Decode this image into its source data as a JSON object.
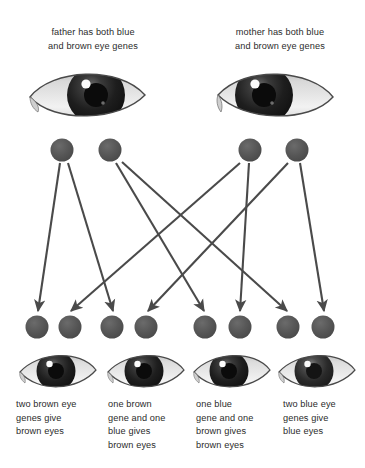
{
  "diagram": {
    "type": "punnett-style inheritance flow",
    "colors": {
      "gene_circle": "#5a5a5a",
      "arrow": "#4a4a4a",
      "text": "#2b2b2b",
      "background": "#ffffff",
      "iris_dark": "#1a1a1a",
      "sclera": "#e8e8e8"
    }
  },
  "parents": [
    {
      "id": "father",
      "caption_lines": [
        "father has both blue",
        "and brown eye genes"
      ],
      "eye": {
        "name": "father-eye",
        "iris": "brown",
        "facing": "right"
      },
      "genes": [
        {
          "id": "father-gene-1",
          "allele": "brown",
          "cx": 62,
          "cy": 150
        },
        {
          "id": "father-gene-2",
          "allele": "blue",
          "cx": 110,
          "cy": 150
        }
      ]
    },
    {
      "id": "mother",
      "caption_lines": [
        "mother has both blue",
        "and brown eye genes"
      ],
      "eye": {
        "name": "mother-eye",
        "iris": "brown",
        "facing": "left"
      },
      "genes": [
        {
          "id": "mother-gene-1",
          "allele": "brown",
          "cx": 250,
          "cy": 150
        },
        {
          "id": "mother-gene-2",
          "allele": "blue",
          "cx": 297,
          "cy": 150
        }
      ]
    }
  ],
  "children": [
    {
      "id": "child-1",
      "caption_lines": [
        "two brown eye",
        "genes give",
        "brown eyes"
      ],
      "eye": {
        "name": "child-eye-1",
        "iris": "brown"
      },
      "genes": [
        {
          "id": "child-1-gene-a",
          "cx": 37,
          "cy": 327
        },
        {
          "id": "child-1-gene-b",
          "cx": 70,
          "cy": 327
        }
      ]
    },
    {
      "id": "child-2",
      "caption_lines": [
        "one brown",
        "gene and one",
        "blue gives",
        "brown eyes"
      ],
      "eye": {
        "name": "child-eye-2",
        "iris": "brown"
      },
      "genes": [
        {
          "id": "child-2-gene-a",
          "cx": 112,
          "cy": 327
        },
        {
          "id": "child-2-gene-b",
          "cx": 146,
          "cy": 327
        }
      ]
    },
    {
      "id": "child-3",
      "caption_lines": [
        "one blue",
        "gene and one",
        "brown gives",
        "brown eyes"
      ],
      "eye": {
        "name": "child-eye-3",
        "iris": "brown"
      },
      "genes": [
        {
          "id": "child-3-gene-a",
          "cx": 205,
          "cy": 327
        },
        {
          "id": "child-3-gene-b",
          "cx": 240,
          "cy": 327
        }
      ]
    },
    {
      "id": "child-4",
      "caption_lines": [
        "two blue eye",
        "genes give",
        "blue eyes"
      ],
      "eye": {
        "name": "child-eye-4",
        "iris": "blue"
      },
      "genes": [
        {
          "id": "child-4-gene-a",
          "cx": 288,
          "cy": 327
        },
        {
          "id": "child-4-gene-b",
          "cx": 323,
          "cy": 327
        }
      ]
    }
  ],
  "arrows": [
    {
      "id": "arrow-f1-c1a",
      "from": "father-gene-1",
      "to": "child-1-gene-a",
      "x1": 60,
      "y1": 163,
      "x2": 38,
      "y2": 311
    },
    {
      "id": "arrow-f1-c2a",
      "from": "father-gene-1",
      "to": "child-2-gene-a",
      "x1": 68,
      "y1": 163,
      "x2": 113,
      "y2": 311
    },
    {
      "id": "arrow-f2-c3a",
      "from": "father-gene-2",
      "to": "child-3-gene-a",
      "x1": 116,
      "y1": 163,
      "x2": 204,
      "y2": 311
    },
    {
      "id": "arrow-f2-c4a",
      "from": "father-gene-2",
      "to": "child-4-gene-a",
      "x1": 122,
      "y1": 162,
      "x2": 287,
      "y2": 311
    },
    {
      "id": "arrow-m1-c1b",
      "from": "mother-gene-1",
      "to": "child-1-gene-b",
      "x1": 240,
      "y1": 163,
      "x2": 71,
      "y2": 311
    },
    {
      "id": "arrow-m1-c3b",
      "from": "mother-gene-1",
      "to": "child-3-gene-b",
      "x1": 249,
      "y1": 163,
      "x2": 240,
      "y2": 311
    },
    {
      "id": "arrow-m2-c2b",
      "from": "mother-gene-2",
      "to": "child-2-gene-b",
      "x1": 288,
      "y1": 163,
      "x2": 148,
      "y2": 311
    },
    {
      "id": "arrow-m2-c4b",
      "from": "mother-gene-2",
      "to": "child-4-gene-b",
      "x1": 300,
      "y1": 163,
      "x2": 324,
      "y2": 311
    }
  ]
}
